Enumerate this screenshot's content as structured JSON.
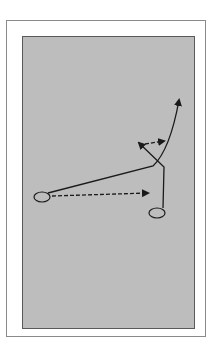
{
  "diagram": {
    "type": "play-diagram",
    "colors": {
      "background": "#ffffff",
      "frame_border": "#8a8a8a",
      "field": "#bdbdbd",
      "field_border": "#5a5a5a",
      "ink": "#1a1a1a"
    },
    "players": [
      {
        "id": "player-left",
        "cx": 42,
        "cy": 197,
        "rx": 8,
        "ry": 5
      },
      {
        "id": "player-right",
        "cx": 157,
        "cy": 213,
        "rx": 8,
        "ry": 5
      }
    ],
    "routes": [
      {
        "id": "route-left-solid-curve",
        "style": "solid",
        "path": "M48 193 L153 166 Q170 150 179 100"
      },
      {
        "id": "route-right-solid",
        "style": "solid",
        "path": "M163 208 L164 167 L139 143"
      },
      {
        "id": "pass-dashed-top",
        "style": "dashed",
        "path": "M145 144 L164 141"
      },
      {
        "id": "pass-dashed-bottom",
        "style": "dashed",
        "path": "M52 196 L148 193"
      }
    ]
  }
}
